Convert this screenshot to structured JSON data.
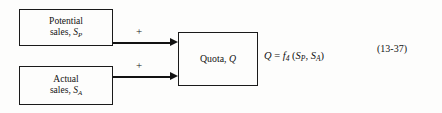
{
  "figure": {
    "equation_number": "(13-37)"
  },
  "blocks": [
    {
      "name": "potential-sales",
      "line1": "Potential",
      "line2_text": "sales, ",
      "line2_var": "S",
      "line2_sub": "P"
    },
    {
      "name": "actual-sales",
      "line1": "Actual",
      "line2_text": "sales, ",
      "line2_var": "S",
      "line2_sub": "A"
    },
    {
      "name": "quota",
      "line1_text": "Quota, ",
      "line1_var": "Q"
    }
  ],
  "arrows": [
    {
      "name": "potential-to-quota",
      "sign": "+"
    },
    {
      "name": "actual-to-quota",
      "sign": "+"
    }
  ],
  "equation": {
    "lhs": "Q",
    "equals": " = ",
    "func": "f",
    "func_sub": "4",
    "open_paren": " (",
    "arg1": "S",
    "arg1_sub": "P",
    "comma": ", ",
    "arg2": "S",
    "arg2_sub": "A",
    "close_paren": ")"
  }
}
